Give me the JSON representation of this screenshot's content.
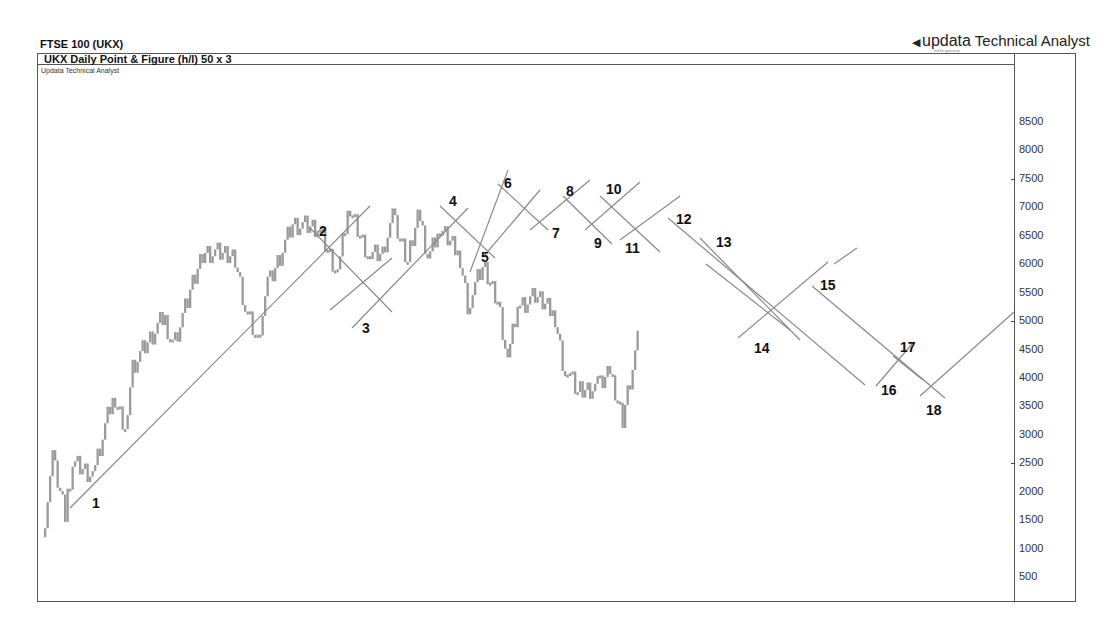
{
  "header": {
    "symbol_title": "FTSE 100 (UKX)",
    "chart_title": "UKX Daily Point & Figure (h/l) 50 x 3",
    "subtitle": "Updata Technical Analyst",
    "logo": {
      "brand": "updata",
      "product": "Technical Analyst",
      "tagline": "find the opportunity"
    }
  },
  "colors": {
    "columns": "#7a7a7a",
    "trendlines": "#8a8a8a",
    "frame": "#555555",
    "text": "#111111"
  },
  "chart_data": {
    "type": "point-and-figure",
    "title": "UKX Daily Point & Figure (h/l) 50 x 3",
    "instrument": "FTSE 100 (UKX)",
    "box_size": 50,
    "reversal": 3,
    "xlabel": "",
    "ylabel": "",
    "ylim": [
      500,
      8500
    ],
    "y_ticks": [
      8500,
      8000,
      7500,
      7000,
      6500,
      6000,
      5500,
      5000,
      4500,
      4000,
      3500,
      3000,
      2500,
      2000,
      1500,
      1000,
      500
    ],
    "grid": false,
    "legend": null,
    "approx_path": [
      {
        "col": 0,
        "price": 1200
      },
      {
        "col": 4,
        "price": 2550
      },
      {
        "col": 9,
        "price": 1650
      },
      {
        "col": 12,
        "price": 2500
      },
      {
        "col": 20,
        "price": 2300
      },
      {
        "col": 28,
        "price": 3650
      },
      {
        "col": 33,
        "price": 3100
      },
      {
        "col": 36,
        "price": 4200
      },
      {
        "col": 48,
        "price": 5050
      },
      {
        "col": 52,
        "price": 4550
      },
      {
        "col": 58,
        "price": 5350
      },
      {
        "col": 64,
        "price": 6200
      },
      {
        "col": 76,
        "price": 6200
      },
      {
        "col": 80,
        "price": 5400
      },
      {
        "col": 86,
        "price": 4700
      },
      {
        "col": 90,
        "price": 5600
      },
      {
        "col": 100,
        "price": 6700
      },
      {
        "col": 110,
        "price": 6650
      },
      {
        "col": 118,
        "price": 5850
      },
      {
        "col": 122,
        "price": 7000
      },
      {
        "col": 130,
        "price": 6200
      },
      {
        "col": 136,
        "price": 6250
      },
      {
        "col": 140,
        "price": 6800
      },
      {
        "col": 146,
        "price": 6100
      },
      {
        "col": 150,
        "price": 6900
      },
      {
        "col": 154,
        "price": 6100
      },
      {
        "col": 158,
        "price": 6600
      },
      {
        "col": 166,
        "price": 6300
      },
      {
        "col": 170,
        "price": 5300
      },
      {
        "col": 176,
        "price": 5950
      },
      {
        "col": 182,
        "price": 5400
      },
      {
        "col": 186,
        "price": 4300
      },
      {
        "col": 190,
        "price": 5250
      },
      {
        "col": 196,
        "price": 5400
      },
      {
        "col": 204,
        "price": 5250
      },
      {
        "col": 208,
        "price": 4300
      },
      {
        "col": 214,
        "price": 3750
      },
      {
        "col": 222,
        "price": 3850
      },
      {
        "col": 226,
        "price": 4150
      },
      {
        "col": 232,
        "price": 3300
      },
      {
        "col": 238,
        "price": 4650
      }
    ],
    "annotations": [
      {
        "label": "1",
        "approx_price": 1650
      },
      {
        "label": "2",
        "approx_price": 6200
      },
      {
        "label": "3",
        "approx_price": 4700
      },
      {
        "label": "4",
        "approx_price": 6700
      },
      {
        "label": "5",
        "approx_price": 5850
      },
      {
        "label": "6",
        "approx_price": 7000
      },
      {
        "label": "7",
        "approx_price": 6200
      },
      {
        "label": "8",
        "approx_price": 6800
      },
      {
        "label": "9",
        "approx_price": 6100
      },
      {
        "label": "10",
        "approx_price": 6900
      },
      {
        "label": "11",
        "approx_price": 6100
      },
      {
        "label": "12",
        "approx_price": 6400
      },
      {
        "label": "13",
        "approx_price": 5950
      },
      {
        "label": "14",
        "approx_price": 4300
      },
      {
        "label": "15",
        "approx_price": 5300
      },
      {
        "label": "16",
        "approx_price": 3750
      },
      {
        "label": "17",
        "approx_price": 4150
      },
      {
        "label": "18",
        "approx_price": 3300
      }
    ]
  }
}
